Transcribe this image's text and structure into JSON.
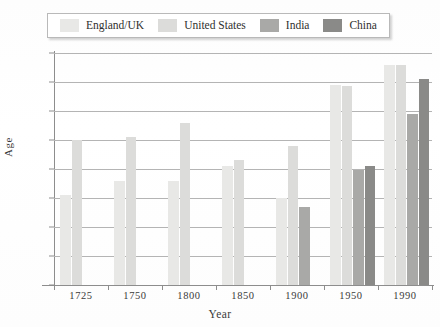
{
  "chart_data": {
    "type": "bar",
    "title": "",
    "xlabel": "Year",
    "ylabel": "Age",
    "categories": [
      "1725",
      "1750",
      "1800",
      "1850",
      "1900",
      "1950",
      "1990"
    ],
    "ylim": [
      0,
      80
    ],
    "yticks": [
      0,
      10,
      20,
      30,
      40,
      50,
      60,
      70,
      80
    ],
    "ytick_labels": [
      "0",
      "10",
      "20",
      "30",
      "40",
      "50",
      "60",
      "70",
      "80"
    ],
    "grid": true,
    "legend_position": "top",
    "series": [
      {
        "name": "England/UK",
        "color": "#e8e8e6",
        "values": [
          31,
          36,
          36,
          41,
          30,
          69,
          76
        ]
      },
      {
        "name": "United States",
        "color": "#dcdcda",
        "values": [
          50,
          51,
          56,
          43,
          48,
          68.5,
          76
        ]
      },
      {
        "name": "India",
        "color": "#a9a9a7",
        "values": [
          null,
          null,
          null,
          null,
          27,
          39.5,
          59
        ]
      },
      {
        "name": "China",
        "color": "#8a8a88",
        "values": [
          null,
          null,
          null,
          null,
          null,
          41,
          71
        ]
      }
    ]
  },
  "legend": {
    "entries": [
      {
        "label": "England/UK",
        "color": "#e8e8e6"
      },
      {
        "label": "United States",
        "color": "#dcdcda"
      },
      {
        "label": "India",
        "color": "#a9a9a7"
      },
      {
        "label": "China",
        "color": "#8a8a88"
      }
    ]
  }
}
